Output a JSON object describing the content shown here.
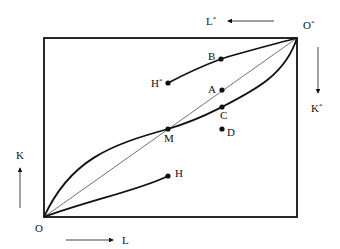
{
  "diagram": {
    "type": "edgeworth-box",
    "origins": {
      "home": "O",
      "foreign": "O",
      "foreign_sup": "*"
    },
    "axes": {
      "home_labor": "L",
      "home_capital": "K",
      "foreign_labor": "L",
      "foreign_labor_sup": "*",
      "foreign_capital": "K",
      "foreign_capital_sup": "*"
    },
    "points": {
      "A": "A",
      "B": "B",
      "C": "C",
      "D": "D",
      "M": "M",
      "H": "H",
      "H_star": "H",
      "H_star_sup": "*"
    },
    "curves": [
      "contract curve O–M–C–O*",
      "diagonal O–O*",
      "home path O–H",
      "foreign path H*–B–O*"
    ],
    "colors": {
      "ink": "#111111",
      "background": "#ffffff"
    }
  }
}
